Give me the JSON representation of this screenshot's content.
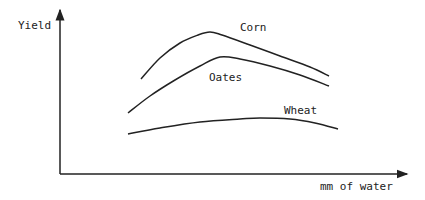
{
  "chart_data": {
    "type": "line",
    "title": "",
    "xlabel": "mm of water",
    "ylabel": "Yield",
    "grid": false,
    "legend": "inline labels",
    "series": [
      {
        "name": "Corn",
        "label_pos": [
          230,
          33
        ],
        "points": [
          [
            141,
            79
          ],
          [
            160,
            58
          ],
          [
            180,
            43
          ],
          [
            198,
            35
          ],
          [
            210,
            32
          ],
          [
            222,
            35
          ],
          [
            250,
            45
          ],
          [
            280,
            56
          ],
          [
            310,
            67
          ],
          [
            329,
            76
          ]
        ]
      },
      {
        "name": "Oates",
        "label_pos": [
          210,
          80
        ],
        "points": [
          [
            128,
            113
          ],
          [
            150,
            96
          ],
          [
            175,
            80
          ],
          [
            200,
            66
          ],
          [
            220,
            57
          ],
          [
            240,
            59
          ],
          [
            270,
            66
          ],
          [
            300,
            75
          ],
          [
            329,
            86
          ]
        ]
      },
      {
        "name": "Wheat",
        "label_pos": [
          281,
          116
        ],
        "points": [
          [
            128,
            134
          ],
          [
            160,
            128
          ],
          [
            200,
            122
          ],
          [
            240,
            119
          ],
          [
            260,
            118
          ],
          [
            290,
            119
          ],
          [
            315,
            123
          ],
          [
            338,
            129
          ]
        ]
      }
    ]
  },
  "labels": {
    "y_axis": "Yield",
    "x_axis": "mm of water",
    "corn": "Corn",
    "oates": "Oates",
    "wheat": "Wheat"
  }
}
